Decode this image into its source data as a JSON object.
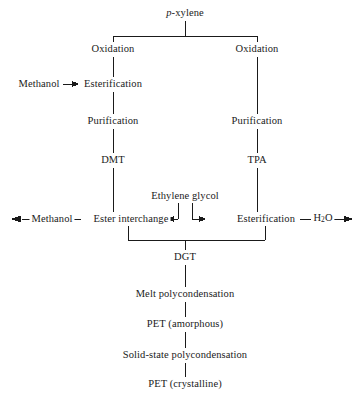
{
  "diagram": {
    "type": "process-flowchart",
    "background_color": "#ffffff",
    "line_color": "#1a1a1a",
    "nodes": [
      {
        "id": "p_xylene",
        "label_prefix": "p",
        "label": "-xylene",
        "x": 185,
        "y": 13,
        "italic_prefix": true
      },
      {
        "id": "oxidation_left",
        "label": "Oxidation",
        "x": 113,
        "y": 49
      },
      {
        "id": "oxidation_right",
        "label": "Oxidation",
        "x": 257,
        "y": 49
      },
      {
        "id": "methanol_in",
        "label": "Methanol",
        "x": 39,
        "y": 84
      },
      {
        "id": "esterification_left",
        "label": "Esterification",
        "x": 113,
        "y": 84
      },
      {
        "id": "purification_left",
        "label": "Purification",
        "x": 113,
        "y": 121
      },
      {
        "id": "purification_right",
        "label": "Purification",
        "x": 257,
        "y": 121
      },
      {
        "id": "dmt",
        "label": "DMT",
        "x": 113,
        "y": 160
      },
      {
        "id": "tpa",
        "label": "TPA",
        "x": 257,
        "y": 160
      },
      {
        "id": "ethylene_glycol",
        "label": "Ethylene glycol",
        "x": 185,
        "y": 196
      },
      {
        "id": "methanol_out",
        "label": "Methanol",
        "x": 52,
        "y": 219
      },
      {
        "id": "ester_interchange",
        "label": "Ester interchange",
        "x": 131,
        "y": 219
      },
      {
        "id": "esterification_right",
        "label": "Esterification",
        "x": 266,
        "y": 219
      },
      {
        "id": "water_out",
        "label": "H",
        "label_sub": "2",
        "label_suffix": "O",
        "x": 323,
        "y": 219
      },
      {
        "id": "dgt",
        "label": "DGT",
        "x": 185,
        "y": 257
      },
      {
        "id": "melt_polycondensation",
        "label": "Melt polycondensation",
        "x": 185,
        "y": 294
      },
      {
        "id": "pet_amorphous",
        "label": "PET (amorphous)",
        "x": 185,
        "y": 324
      },
      {
        "id": "solid_state_polycondensation",
        "label": "Solid-state polycondensation",
        "x": 185,
        "y": 355
      },
      {
        "id": "pet_crystalline",
        "label": "PET (crystalline)",
        "x": 185,
        "y": 384
      }
    ],
    "edges": [
      {
        "id": "edge-pxylene-split",
        "kind": "split-down"
      },
      {
        "id": "edge-oxidation-left-to-esterification",
        "kind": "vertical"
      },
      {
        "id": "edge-methanol-to-esterification",
        "kind": "arrow-right"
      },
      {
        "id": "edge-esterification-to-purification-left",
        "kind": "vertical"
      },
      {
        "id": "edge-purification-left-to-dmt",
        "kind": "vertical"
      },
      {
        "id": "edge-dmt-to-ester-interchange",
        "kind": "vertical"
      },
      {
        "id": "edge-oxidation-right-to-purification",
        "kind": "vertical"
      },
      {
        "id": "edge-purification-right-to-tpa",
        "kind": "vertical"
      },
      {
        "id": "edge-tpa-to-esterification-right",
        "kind": "vertical"
      },
      {
        "id": "edge-glycol-to-ester-interchange",
        "kind": "elbow-arrow-left"
      },
      {
        "id": "edge-glycol-to-esterification",
        "kind": "elbow-arrow-right"
      },
      {
        "id": "edge-ester-interchange-to-methanol-out",
        "kind": "arrow-left"
      },
      {
        "id": "edge-esterification-to-water-out",
        "kind": "arrow-right"
      },
      {
        "id": "edge-merge-to-dgt",
        "kind": "merge-down"
      },
      {
        "id": "edge-dgt-to-melt",
        "kind": "vertical"
      },
      {
        "id": "edge-melt-to-pet-amorphous",
        "kind": "vertical"
      },
      {
        "id": "edge-pet-amorphous-to-solid-state",
        "kind": "vertical"
      },
      {
        "id": "edge-solid-state-to-pet-crystalline",
        "kind": "vertical"
      }
    ]
  }
}
